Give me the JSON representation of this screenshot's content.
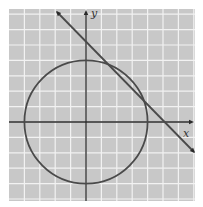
{
  "chart_data": {
    "type": "line",
    "title": "",
    "xlabel": "x",
    "ylabel": "y",
    "xlim": [
      -5,
      7
    ],
    "ylim": [
      -5,
      7
    ],
    "grid": true,
    "grid_spacing": 1,
    "legend": null,
    "series": [
      {
        "name": "circle",
        "kind": "circle",
        "equation": "x^2 + y^2 = 16",
        "center": [
          0,
          0
        ],
        "radius": 4
      },
      {
        "name": "line",
        "kind": "line",
        "equation": "x + y = 5",
        "x": [
          -1.9,
          7
        ],
        "y": [
          7,
          -2
        ]
      }
    ],
    "intersections": [
      [
        1.18,
        3.82
      ],
      [
        3.82,
        1.18
      ]
    ]
  },
  "colors": {
    "background": "#c8c8c8",
    "grid": "#f2f2f2",
    "axes": "#2a2a2a",
    "curve": "#4a4a4a"
  },
  "labels": {
    "x_axis": "x",
    "y_axis": "y"
  }
}
